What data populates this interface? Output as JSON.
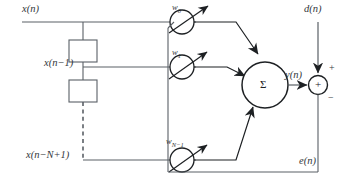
{
  "figure": {
    "kind": "block-diagram",
    "background_color": "#ffffff",
    "line_color": "#5a6066",
    "bold_line_color": "#1d2023",
    "text_color": "#33373b"
  },
  "signals": {
    "input": "x(n)",
    "delayed_1": "x(n−1)",
    "delayed_n": "x(n−N+1)",
    "desired": "d(n)",
    "output": "y(n)",
    "error": "e(n)"
  },
  "weights": [
    {
      "name": "w0",
      "label_base": "w",
      "label_sub": "0"
    },
    {
      "name": "w1",
      "label_base": "w",
      "label_sub": "1"
    },
    {
      "name": "wN-1",
      "label_base": "w",
      "label_sub": "N−1"
    }
  ],
  "nodes": {
    "summation_symbol": "Σ",
    "adder_symbol": "+",
    "adder_plus_sign": "+",
    "adder_minus_sign": "−"
  },
  "delay_blocks": [
    {
      "name": "delay-1",
      "label": ""
    },
    {
      "name": "delay-2",
      "label": ""
    }
  ]
}
